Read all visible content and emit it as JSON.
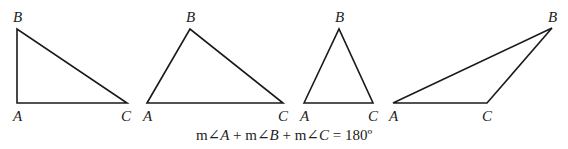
{
  "diagram": {
    "stroke_color": "#1a1a1a",
    "stroke_width": 1.6,
    "triangles": [
      {
        "name": "right-triangle",
        "vertices": {
          "A": {
            "x": 17,
            "y": 103,
            "label": "A",
            "lx": 13,
            "ly": 121
          },
          "B": {
            "x": 17,
            "y": 29,
            "label": "B",
            "lx": 13,
            "ly": 22
          },
          "C": {
            "x": 127,
            "y": 103,
            "label": "C",
            "lx": 121,
            "ly": 121
          }
        }
      },
      {
        "name": "acute-scalene-triangle",
        "vertices": {
          "A": {
            "x": 147,
            "y": 103,
            "label": "A",
            "lx": 143,
            "ly": 121
          },
          "B": {
            "x": 190,
            "y": 29,
            "label": "B",
            "lx": 186,
            "ly": 22
          },
          "C": {
            "x": 283,
            "y": 103,
            "label": "C",
            "lx": 278,
            "ly": 121
          }
        }
      },
      {
        "name": "isosceles-triangle",
        "vertices": {
          "A": {
            "x": 304,
            "y": 103,
            "label": "A",
            "lx": 300,
            "ly": 121
          },
          "B": {
            "x": 339,
            "y": 29,
            "label": "B",
            "lx": 335,
            "ly": 22
          },
          "C": {
            "x": 373,
            "y": 103,
            "label": "C",
            "lx": 368,
            "ly": 121
          }
        }
      },
      {
        "name": "obtuse-triangle",
        "vertices": {
          "A": {
            "x": 393,
            "y": 103,
            "label": "A",
            "lx": 389,
            "ly": 121
          },
          "B": {
            "x": 552,
            "y": 28,
            "label": "B",
            "lx": 548,
            "ly": 22
          },
          "C": {
            "x": 487,
            "y": 103,
            "label": "C",
            "lx": 482,
            "ly": 121
          }
        }
      }
    ],
    "equation": {
      "parts": [
        {
          "text": "m∠",
          "italic": false
        },
        {
          "text": "A",
          "italic": true
        },
        {
          "text": " + m∠",
          "italic": false
        },
        {
          "text": "B",
          "italic": true
        },
        {
          "text": " + m∠",
          "italic": false
        },
        {
          "text": "C",
          "italic": true
        },
        {
          "text": " = 180º",
          "italic": false
        }
      ]
    }
  }
}
